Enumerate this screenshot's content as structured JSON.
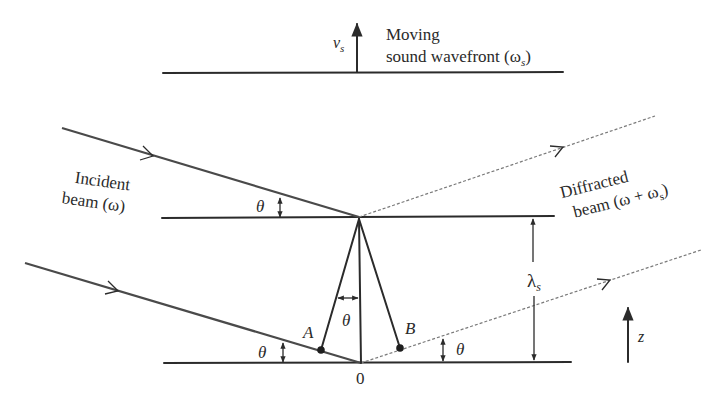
{
  "figure": {
    "top": {
      "velocity_label": "v",
      "velocity_sub": "s",
      "wavefront_line1": "Moving",
      "wavefront_line2": "sound wavefront (ω",
      "wavefront_sub": "s",
      "wavefront_close": ")"
    },
    "incident": {
      "line1": "Incident",
      "line2": "beam (ω)"
    },
    "diffracted": {
      "line1": "Diffracted",
      "line2": "beam (ω + ω",
      "line2_sub": "s",
      "line2_close": ")"
    },
    "angles": {
      "theta": "θ"
    },
    "points": {
      "A": "A",
      "B": "B",
      "origin": "0"
    },
    "wavelength": {
      "symbol": "λ",
      "sub": "s"
    },
    "axis": {
      "z": "z"
    },
    "colors": {
      "line": "#2b2b2b",
      "dashed": "#7a7a7a",
      "text": "#2a2a2a",
      "background": "#ffffff"
    }
  }
}
